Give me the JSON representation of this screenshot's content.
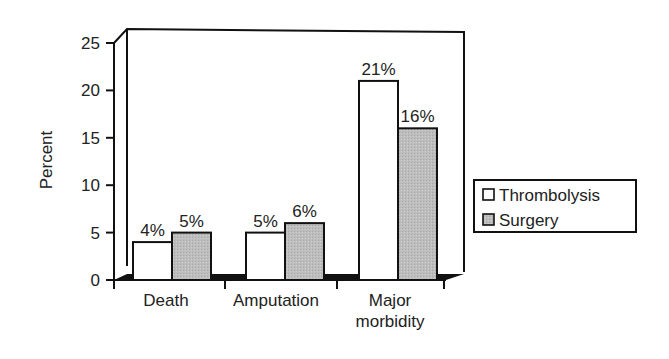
{
  "chart_data": {
    "type": "bar",
    "title": "",
    "xlabel": "",
    "ylabel": "Percent",
    "ylim": [
      0,
      25
    ],
    "yticks": [
      0,
      5,
      10,
      15,
      20,
      25
    ],
    "categories": [
      "Death",
      "Amputation",
      "Major morbidity"
    ],
    "category_lines": [
      [
        "Death"
      ],
      [
        "Amputation"
      ],
      [
        "Major",
        "morbidity"
      ]
    ],
    "series": [
      {
        "name": "Thrombolysis",
        "values": [
          4,
          5,
          21
        ],
        "labels": [
          "4%",
          "5%",
          "21%"
        ],
        "color": "#ffffff"
      },
      {
        "name": "Surgery",
        "values": [
          5,
          6,
          16
        ],
        "labels": [
          "5%",
          "6%",
          "16%"
        ],
        "color": "#b8b8b8"
      }
    ],
    "legend": {
      "position": "right",
      "entries": [
        "Thrombolysis",
        "Surgery"
      ]
    },
    "grid": false,
    "style": "3d-box"
  }
}
